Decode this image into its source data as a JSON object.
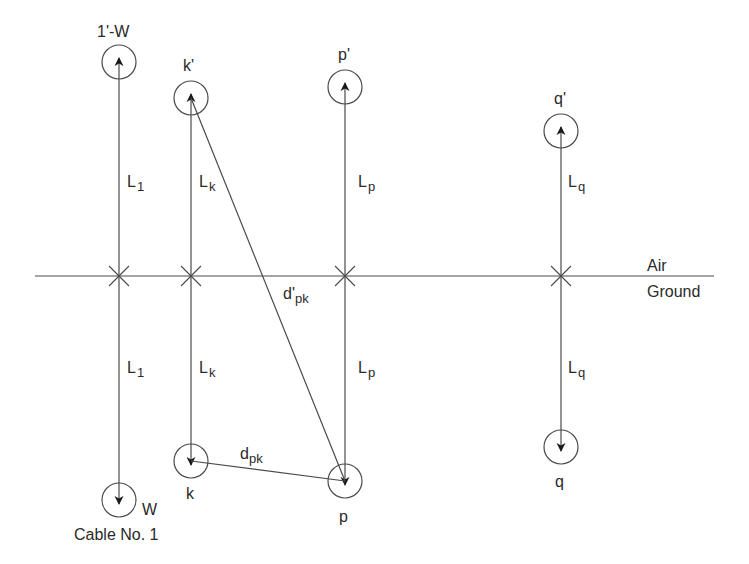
{
  "diagram": {
    "type": "cable image-method geometry",
    "boundary": {
      "above_label": "Air",
      "below_label": "Ground",
      "y": 276,
      "x1": 35,
      "x2": 714
    },
    "conductors": [
      {
        "id": "1",
        "x": 119,
        "image_y": 62,
        "real_y": 500,
        "image_label": "1'-W",
        "real_label": "W",
        "length_label_main": "L",
        "length_label_sub": "1",
        "caption": "Cable No. 1"
      },
      {
        "id": "k",
        "x": 191,
        "image_y": 98,
        "real_y": 461,
        "image_label": "k'",
        "real_label": "k",
        "length_label_main": "L",
        "length_label_sub": "k"
      },
      {
        "id": "p",
        "x": 345,
        "image_y": 87,
        "real_y": 481,
        "image_label": "p'",
        "real_label": "p",
        "length_label_main": "L",
        "length_label_sub": "p"
      },
      {
        "id": "q",
        "x": 561,
        "image_y": 131,
        "real_y": 447,
        "image_label": "q'",
        "real_label": "q",
        "length_label_main": "L",
        "length_label_sub": "q"
      }
    ],
    "distances": [
      {
        "from": "k",
        "to": "p",
        "label_main": "d",
        "label_sub": "pk"
      },
      {
        "from": "k'",
        "to": "p",
        "label_main": "d'",
        "label_sub": "pk"
      }
    ],
    "colors": {
      "line": "#4a4a4a",
      "text": "#2a2a2a",
      "background": "#ffffff"
    }
  }
}
